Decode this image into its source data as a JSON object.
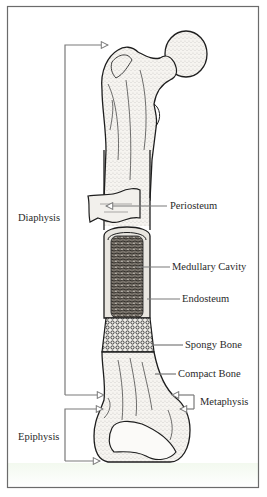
{
  "figure": {
    "colors": {
      "frame": "#6b6b6b",
      "leader": "#7a7a7a",
      "bone_outline": "#1e1e1e",
      "bone_fill": "#f4f2ee",
      "marrow": "#5a5550",
      "text": "#2a2a2a"
    }
  },
  "labels": {
    "left": {
      "diaphysis": "Diaphysis",
      "epiphysis": "Epiphysis"
    },
    "right": {
      "periosteum": "Periosteum",
      "medullary_cavity": "Medullary Cavity",
      "endosteum": "Endosteum",
      "spongy_bone": "Spongy Bone",
      "compact_bone": "Compact Bone",
      "metaphysis": "Metaphysis"
    }
  }
}
